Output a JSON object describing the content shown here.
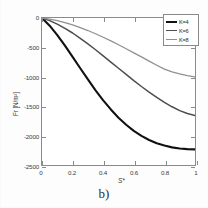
{
  "figure": {
    "caption": "b)"
  },
  "axes": {
    "xlabel": "S*",
    "ylabel": "Fr [N/m²]",
    "xticks": [
      "0",
      "0.2",
      "0.4",
      "0.6",
      "0.8",
      "1"
    ],
    "yticks": [
      "0",
      "-500",
      "-1000",
      "-1500",
      "-2000",
      "-2500"
    ]
  },
  "legend": {
    "items": [
      {
        "label": "K=4",
        "color": "#111111",
        "width": 2.1
      },
      {
        "label": "K=6",
        "color": "#4d4d4d",
        "width": 1.5
      },
      {
        "label": "K=8",
        "color": "#909090",
        "width": 1.3
      }
    ]
  },
  "chart_data": {
    "type": "line",
    "title": "",
    "xlabel": "S*",
    "ylabel": "Fr [N/m²]",
    "xlim": [
      0,
      1
    ],
    "ylim": [
      -2500,
      0
    ],
    "xticks": [
      0,
      0.2,
      0.4,
      0.6,
      0.8,
      1
    ],
    "yticks": [
      0,
      -500,
      -1000,
      -1500,
      -2000,
      -2500
    ],
    "grid": false,
    "legend_position": "top-right",
    "x": [
      0,
      0.05,
      0.1,
      0.15,
      0.2,
      0.25,
      0.3,
      0.35,
      0.4,
      0.45,
      0.5,
      0.55,
      0.6,
      0.65,
      0.7,
      0.75,
      0.8,
      0.85,
      0.9,
      0.95,
      1
    ],
    "series": [
      {
        "name": "K=4",
        "color": "#111111",
        "values": [
          0,
          -130,
          -290,
          -470,
          -660,
          -855,
          -1045,
          -1230,
          -1400,
          -1555,
          -1695,
          -1815,
          -1920,
          -2005,
          -2075,
          -2130,
          -2170,
          -2200,
          -2220,
          -2230,
          -2235
        ]
      },
      {
        "name": "K=6",
        "color": "#4d4d4d",
        "values": [
          0,
          -45,
          -105,
          -175,
          -255,
          -345,
          -440,
          -540,
          -645,
          -750,
          -855,
          -960,
          -1065,
          -1165,
          -1260,
          -1350,
          -1435,
          -1510,
          -1575,
          -1625,
          -1660
        ]
      },
      {
        "name": "K=8",
        "color": "#909090",
        "values": [
          0,
          -20,
          -45,
          -78,
          -118,
          -163,
          -213,
          -268,
          -327,
          -390,
          -455,
          -523,
          -592,
          -662,
          -733,
          -803,
          -870,
          -918,
          -952,
          -980,
          -1000
        ]
      }
    ]
  }
}
